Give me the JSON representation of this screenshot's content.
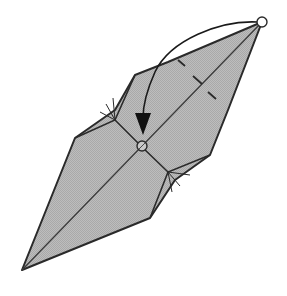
{
  "diagram": {
    "type": "origami-fold-step",
    "description": "Fold the top point down to the marked center point",
    "colors": {
      "paper_fill": "#b4b4b4",
      "outline": "#2a2a2a",
      "background": "#ffffff",
      "arrow": "#1a1a1a"
    },
    "markers": {
      "start_point": "circle-marker-at-top-tip",
      "target_point": "circle-marker-at-center"
    },
    "symbols": [
      "valley-fold-arrow",
      "hidden-edge-ticks",
      "circle-marker",
      "arrowhead"
    ]
  }
}
